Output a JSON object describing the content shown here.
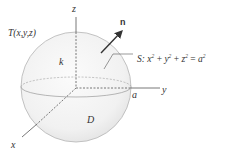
{
  "figure": {
    "labels": {
      "z_axis": "z",
      "y_axis": "y",
      "x_axis": "x",
      "point": "T(x,y,z)",
      "normal": "n",
      "conductivity": "k",
      "region": "D",
      "radius": "a",
      "surface_prefix": "S: ",
      "surface_x": "x",
      "surface_y": "y",
      "surface_z": "z",
      "surface_a": "a",
      "surface_exp": "2",
      "surface_plus": " + ",
      "surface_eq": " = "
    },
    "colors": {
      "sphere_fill": "#f3f3f3",
      "sphere_edge": "#b5b5b5",
      "axis": "#555555",
      "text": "#333333",
      "arrow": "#333333"
    }
  }
}
